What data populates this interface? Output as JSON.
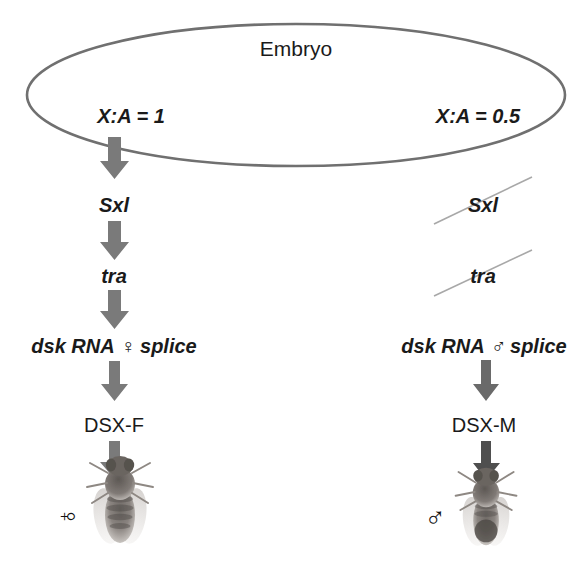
{
  "figure": {
    "type": "pathway-diagram",
    "container_label": "Embryo",
    "container_shape": "ellipse",
    "outline_color": "#6f6f6f",
    "arrow_color": "#7a7a7a",
    "text_color": "#1a1a1a",
    "strike_color": "#9a9a9a"
  },
  "branches": {
    "female": {
      "ratio_label": "X:A = 1",
      "steps": [
        {
          "label": "Sxl",
          "style": "italic",
          "struck": false
        },
        {
          "label": "tra",
          "style": "italic",
          "struck": false
        },
        {
          "label": "dsk RNA ♀ splice",
          "style": "italic",
          "struck": false
        },
        {
          "label": "DSX-F",
          "style": "plain",
          "struck": false
        }
      ],
      "organism_symbol": "♀",
      "organism_symbol_name": "female-symbol",
      "organism_symbol_rotated": "true",
      "organism_image_name": "fruit-fly-female-photo"
    },
    "male": {
      "ratio_label": "X:A = 0.5",
      "steps": [
        {
          "label": "Sxl",
          "style": "italic",
          "struck": true
        },
        {
          "label": "tra",
          "style": "italic",
          "struck": true
        },
        {
          "label": "dsk RNA ♂ splice",
          "style": "italic",
          "struck": false
        },
        {
          "label": "DSX-M",
          "style": "plain",
          "struck": false
        }
      ],
      "organism_symbol": "♂",
      "organism_symbol_name": "male-symbol",
      "organism_symbol_rotated": "false",
      "organism_image_name": "fruit-fly-male-photo"
    }
  }
}
